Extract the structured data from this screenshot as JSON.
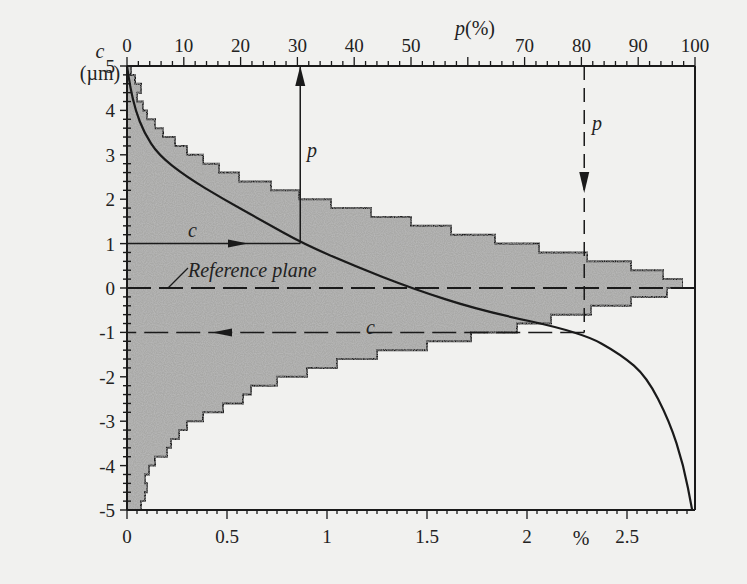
{
  "chart_data": {
    "type": "area",
    "subtype": "histogram-with-cumulative-curve (Abbott-Firestone bearing curve)",
    "title": "",
    "y_axis": {
      "label": "c",
      "unit": "(µm)",
      "ticks": [
        5,
        4,
        3,
        2,
        1,
        0,
        -1,
        -2,
        -3,
        -4,
        -5
      ],
      "tick_labels": [
        "5",
        "4",
        "3",
        "2",
        "1",
        "0",
        "-1",
        "-2",
        "-3",
        "-4",
        "-5"
      ],
      "range": [
        -5,
        5
      ],
      "minor_tick_step": 0.2
    },
    "x_axis_top": {
      "label": "p(%)",
      "ticks": [
        0,
        10,
        20,
        30,
        40,
        50,
        70,
        80,
        90,
        100
      ],
      "tick_labels": [
        "0",
        "10",
        "20",
        "30",
        "40",
        "50",
        "70",
        "80",
        "90",
        "100"
      ],
      "range": [
        0,
        100
      ],
      "minor_tick_step": 2
    },
    "x_axis_bottom": {
      "label": "%",
      "ticks": [
        0,
        0.5,
        1,
        1.5,
        2,
        2.5
      ],
      "tick_labels": [
        "0",
        "0.5",
        "1",
        "1.5",
        "2",
        "2.5"
      ],
      "range": [
        0,
        2.82
      ],
      "minor_tick_step": 0.05
    },
    "series": [
      {
        "name": "amplitude density histogram",
        "axis": "bottom (%)",
        "style": "stepped, gray stippled fill",
        "bins_c_top_width_pct": [
          [
            5.0,
            0.02
          ],
          [
            4.8,
            0.04
          ],
          [
            4.6,
            0.07
          ],
          [
            4.4,
            0.05
          ],
          [
            4.2,
            0.08
          ],
          [
            4.0,
            0.1
          ],
          [
            3.8,
            0.14
          ],
          [
            3.6,
            0.18
          ],
          [
            3.4,
            0.24
          ],
          [
            3.2,
            0.3
          ],
          [
            3.0,
            0.38
          ],
          [
            2.8,
            0.46
          ],
          [
            2.6,
            0.56
          ],
          [
            2.4,
            0.72
          ],
          [
            2.2,
            0.86
          ],
          [
            2.0,
            1.02
          ],
          [
            1.8,
            1.22
          ],
          [
            1.6,
            1.42
          ],
          [
            1.4,
            1.62
          ],
          [
            1.2,
            1.84
          ],
          [
            1.0,
            2.06
          ],
          [
            0.8,
            2.3
          ],
          [
            0.6,
            2.52
          ],
          [
            0.4,
            2.68
          ],
          [
            0.2,
            2.78
          ],
          [
            0.0,
            2.7
          ],
          [
            -0.2,
            2.52
          ],
          [
            -0.4,
            2.32
          ],
          [
            -0.6,
            2.12
          ],
          [
            -0.8,
            1.95
          ],
          [
            -1.0,
            1.72
          ],
          [
            -1.2,
            1.5
          ],
          [
            -1.4,
            1.25
          ],
          [
            -1.6,
            1.05
          ],
          [
            -1.8,
            0.9
          ],
          [
            -2.0,
            0.75
          ],
          [
            -2.2,
            0.62
          ],
          [
            -2.4,
            0.58
          ],
          [
            -2.6,
            0.48
          ],
          [
            -2.8,
            0.38
          ],
          [
            -3.0,
            0.3
          ],
          [
            -3.2,
            0.26
          ],
          [
            -3.4,
            0.22
          ],
          [
            -3.6,
            0.2
          ],
          [
            -3.8,
            0.14
          ],
          [
            -4.0,
            0.11
          ],
          [
            -4.2,
            0.09
          ],
          [
            -4.4,
            0.1
          ],
          [
            -4.6,
            0.09
          ],
          [
            -4.8,
            0.07
          ]
        ]
      },
      {
        "name": "bearing ratio curve p(c)",
        "axis": "top (p %)",
        "style": "solid line",
        "points_c_p": [
          [
            5.0,
            0
          ],
          [
            4.5,
            0.6
          ],
          [
            4.0,
            1.5
          ],
          [
            3.5,
            3.0
          ],
          [
            3.0,
            5.5
          ],
          [
            2.5,
            10.5
          ],
          [
            2.0,
            17
          ],
          [
            1.5,
            24
          ],
          [
            1.0,
            31
          ],
          [
            0.5,
            40
          ],
          [
            0.0,
            50
          ],
          [
            -0.5,
            62
          ],
          [
            -1.0,
            80
          ],
          [
            -1.5,
            87
          ],
          [
            -2.0,
            91.5
          ],
          [
            -3.0,
            95.5
          ],
          [
            -4.0,
            98
          ],
          [
            -5.0,
            99.5
          ]
        ]
      }
    ],
    "annotations": [
      {
        "text": "c",
        "at_c": 1.0,
        "desc": "solid horizontal arrow at c=1 µm pointing right to curve, then vertical arrow up to p≈31%"
      },
      {
        "text": "p",
        "at_p": 31,
        "desc": "label on vertical solid line from curve to top axis"
      },
      {
        "text": "p",
        "at_p": 80,
        "desc": "dashed vertical arrow from top axis down at p=80% to curve"
      },
      {
        "text": "c",
        "at_c": -1.0,
        "desc": "dashed horizontal arrow at c=-1 µm pointing left to c axis"
      },
      {
        "text": "Reference plane",
        "at_c": 0.0,
        "desc": "dashed horizontal line at c=0 with leader line"
      }
    ],
    "grid": false,
    "legend": null
  },
  "labels": {
    "y_title_c": "c",
    "y_title_unit": "(µm)",
    "top_title": "p(%)",
    "bottom_title": "%",
    "ref_plane": "Reference plane",
    "ann_c_upper": "c",
    "ann_p_upper": "p",
    "ann_p_right": "p",
    "ann_c_lower": "c"
  }
}
